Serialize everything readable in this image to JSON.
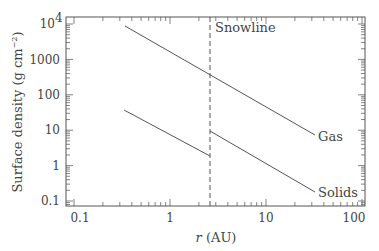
{
  "chart_data": {
    "type": "line",
    "title": "",
    "xlabel": "r (AU)",
    "ylabel": "Surface density (g cm^-2)",
    "xscale": "log",
    "yscale": "log",
    "xlim": [
      0.09,
      110
    ],
    "ylim": [
      0.07,
      14000
    ],
    "x_ticks": [
      "0.1",
      "1",
      "10",
      "100"
    ],
    "y_ticks": [
      "0.1",
      "1",
      "10",
      "100",
      "1000",
      "10^4"
    ],
    "grid": false,
    "snowline": {
      "label": "Snowline",
      "x": 2.7,
      "style": "dashed"
    },
    "series": [
      {
        "name": "Gas",
        "x": [
          0.35,
          2.7,
          36
        ],
        "values": [
          9000,
          500,
          7
        ]
      },
      {
        "name": "Solids (inside snowline)",
        "x": [
          0.35,
          2.7
        ],
        "values": [
          37,
          1.9
        ]
      },
      {
        "name": "Solids",
        "x": [
          2.7,
          36
        ],
        "values": [
          7.5,
          0.18
        ]
      }
    ]
  },
  "labels": {
    "snowline": "Snowline",
    "gas": "Gas",
    "solids": "Solids",
    "xlabel_italic": "r",
    "xlabel_unit": " (AU)",
    "ylabel_main": "Surface density (g cm",
    "ylabel_exp": "−2",
    "ylabel_close": ")",
    "xtick_0": "0.1",
    "xtick_1": "1",
    "xtick_2": "10",
    "xtick_3": "100",
    "ytick_0": "0.1",
    "ytick_1": "1",
    "ytick_2": "10",
    "ytick_3": "100",
    "ytick_4": "1000",
    "ytick_5_base": "10",
    "ytick_5_exp": "4"
  },
  "colors": {
    "axis": "#555555",
    "line": "#555555",
    "text": "#444444"
  }
}
